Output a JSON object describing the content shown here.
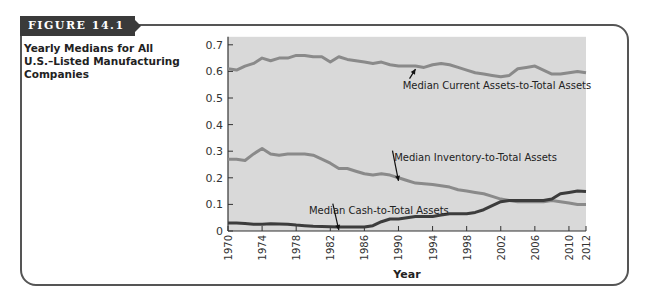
{
  "figure": {
    "tag": "FIGURE 14.1",
    "caption": "Yearly Medians for All U.S.–Listed Manufacturing Companies"
  },
  "chart_data": {
    "type": "line",
    "title": "Yearly Medians for All U.S.–Listed Manufacturing Companies",
    "xlabel": "Year",
    "ylabel": "",
    "ylim": [
      0,
      0.7
    ],
    "xlim": [
      1970,
      2012
    ],
    "grid": false,
    "legend": "inline annotations with arrows",
    "yticks": [
      "0",
      "0.1",
      "0.2",
      "0.3",
      "0.4",
      "0.5",
      "0.6",
      "0.7"
    ],
    "xticks": [
      "1970",
      "1974",
      "1978",
      "1982",
      "1986",
      "1990",
      "1994",
      "1998",
      "2002",
      "2006",
      "2010",
      "2012"
    ],
    "x": [
      1970,
      1971,
      1972,
      1973,
      1974,
      1975,
      1976,
      1977,
      1978,
      1979,
      1980,
      1981,
      1982,
      1983,
      1984,
      1985,
      1986,
      1987,
      1988,
      1989,
      1990,
      1991,
      1992,
      1993,
      1994,
      1995,
      1996,
      1997,
      1998,
      1999,
      2000,
      2001,
      2002,
      2003,
      2004,
      2005,
      2006,
      2007,
      2008,
      2009,
      2010,
      2011,
      2012
    ],
    "series": [
      {
        "name": "Median Current Assets-to-Total Assets",
        "color": "#8a8a8a",
        "values": [
          0.61,
          0.605,
          0.62,
          0.63,
          0.65,
          0.64,
          0.65,
          0.65,
          0.66,
          0.66,
          0.655,
          0.655,
          0.635,
          0.655,
          0.645,
          0.64,
          0.635,
          0.63,
          0.635,
          0.625,
          0.62,
          0.62,
          0.62,
          0.615,
          0.625,
          0.63,
          0.625,
          0.615,
          0.605,
          0.595,
          0.59,
          0.585,
          0.58,
          0.585,
          0.61,
          0.615,
          0.62,
          0.605,
          0.59,
          0.59,
          0.595,
          0.6,
          0.595
        ]
      },
      {
        "name": "Median Inventory-to-Total Assets",
        "color": "#8a8a8a",
        "values": [
          0.27,
          0.27,
          0.265,
          0.29,
          0.31,
          0.29,
          0.285,
          0.29,
          0.29,
          0.29,
          0.285,
          0.27,
          0.255,
          0.235,
          0.235,
          0.225,
          0.215,
          0.21,
          0.215,
          0.21,
          0.2,
          0.19,
          0.18,
          0.178,
          0.175,
          0.17,
          0.165,
          0.155,
          0.15,
          0.145,
          0.14,
          0.13,
          0.12,
          0.115,
          0.11,
          0.11,
          0.11,
          0.11,
          0.115,
          0.11,
          0.105,
          0.1,
          0.1
        ]
      },
      {
        "name": "Median Cash-to-Total Assets",
        "color": "#3c3c3c",
        "values": [
          0.03,
          0.03,
          0.028,
          0.025,
          0.025,
          0.027,
          0.026,
          0.025,
          0.022,
          0.02,
          0.018,
          0.017,
          0.016,
          0.015,
          0.015,
          0.015,
          0.015,
          0.02,
          0.035,
          0.045,
          0.045,
          0.05,
          0.055,
          0.055,
          0.055,
          0.06,
          0.065,
          0.065,
          0.065,
          0.07,
          0.08,
          0.095,
          0.11,
          0.115,
          0.115,
          0.115,
          0.115,
          0.115,
          0.12,
          0.14,
          0.145,
          0.15,
          0.148
        ]
      }
    ],
    "annotations": [
      {
        "text": "Median Current Assets-to-Total Assets",
        "arrow_to_year": 1992,
        "label_x": 1990.5,
        "label_y": 0.535
      },
      {
        "text": "Median Inventory-to-Total Assets",
        "arrow_to_year": 1990,
        "label_x": 1989.5,
        "label_y": 0.265
      },
      {
        "text": "Median Cash-to-Total Assets",
        "arrow_to_year": 1983,
        "label_x": 1979.5,
        "label_y": 0.065
      }
    ]
  },
  "colors": {
    "plot_bg": "#d9d9d9",
    "tag_bg": "#3a3a3a",
    "frame": "#555555"
  }
}
